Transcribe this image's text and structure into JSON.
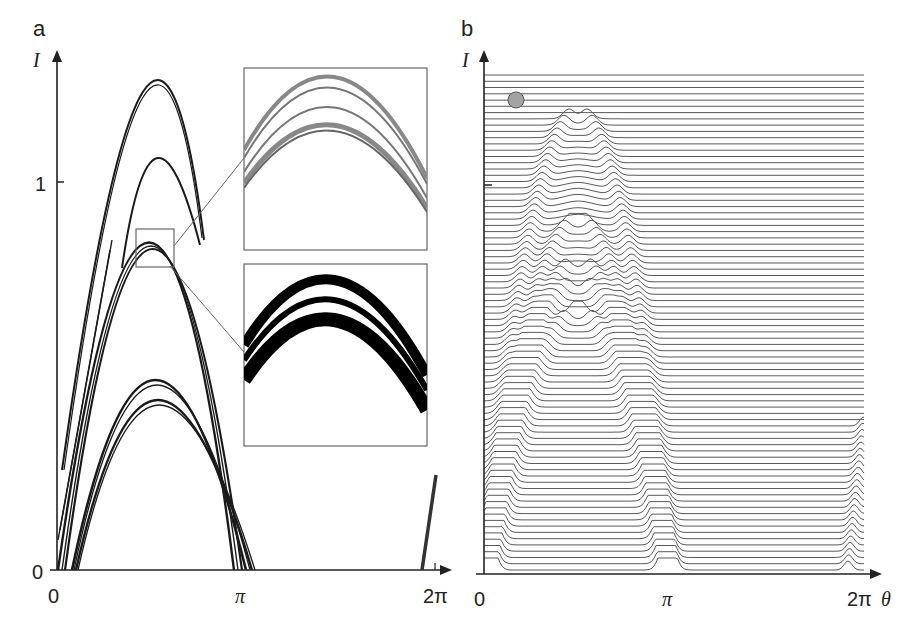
{
  "chart_data": [
    {
      "panel": "a",
      "type": "line",
      "title": "",
      "xlabel": "",
      "ylabel": "I",
      "x_ticks": [
        "0",
        "π",
        "2π"
      ],
      "y_ticks": [
        "0",
        "1"
      ],
      "xlim": [
        0,
        6.283
      ],
      "ylim": [
        0,
        1.25
      ],
      "grid": false,
      "description": "Nested parabolic arcs of intensity vs angle, with a zoomed inset (grey-scale) and a thresholded binary inset of the boxed region near the apex",
      "series": [
        {
          "name": "arc-top-1",
          "apex_theta": 1.57,
          "apex_I": 1.12,
          "theta_start": 0.0,
          "theta_end": 3.0
        },
        {
          "name": "arc-top-2",
          "apex_theta": 1.57,
          "apex_I": 1.06,
          "theta_start": 0.55,
          "theta_end": 3.0
        },
        {
          "name": "arc-group-1",
          "apex_theta": 1.57,
          "apex_I": 0.86,
          "theta_start": 0.05,
          "theta_end": 3.3
        },
        {
          "name": "arc-group-2",
          "apex_theta": 1.57,
          "apex_I": 0.68,
          "theta_start": 0.12,
          "theta_end": 3.4
        },
        {
          "name": "arc-group-3",
          "apex_theta": 1.57,
          "apex_I": 0.6,
          "theta_start": 0.15,
          "theta_end": 3.45
        }
      ],
      "annotations": [
        "inset: grey-scale zoom of apex region",
        "inset: binarized zoom of apex region",
        "short steep line segment near 2π"
      ]
    },
    {
      "panel": "b",
      "type": "line",
      "title": "",
      "xlabel": "θ",
      "ylabel": "I",
      "x_ticks": [
        "0",
        "π",
        "2π"
      ],
      "xlim": [
        0,
        6.283
      ],
      "grid": false,
      "description": "Waterfall stack of ~80 horizontal traces, each showing peaks that trace out parabolic arcs; grey marker circle at top-left",
      "trace_count": 80,
      "marker": {
        "shape": "circle",
        "color": "#a0a0a0"
      }
    }
  ],
  "panels": {
    "a": {
      "label": "a",
      "y_axis_label": "I",
      "y_tick_0": "0",
      "y_tick_1": "1",
      "x_tick_0": "0",
      "x_tick_pi": "π",
      "x_tick_2pi": "2π"
    },
    "b": {
      "label": "b",
      "y_axis_label": "I",
      "x_axis_label": "θ",
      "x_tick_0": "0",
      "x_tick_pi": "π",
      "x_tick_2pi": "2π"
    }
  },
  "colors": {
    "line": "#1a1a1a",
    "trace": "#5a5a5a",
    "marker_fill": "#a3a3a3",
    "marker_stroke": "#555555",
    "box": "#666666"
  }
}
